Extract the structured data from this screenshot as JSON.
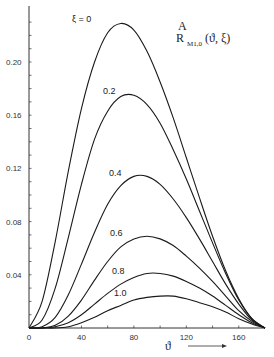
{
  "chart_data": {
    "type": "line",
    "title_parts": {
      "main": "R",
      "sup": "A",
      "sub": "M1,0",
      "args": "(ϑ, ξ)"
    },
    "xlabel": "ϑ",
    "ylabel": "",
    "xlim": [
      0,
      180
    ],
    "ylim": [
      0,
      0.24
    ],
    "x_ticks": [
      0,
      40,
      80,
      120,
      160
    ],
    "x_tick_labels": [
      "0",
      "40",
      "80",
      "120",
      "160"
    ],
    "y_ticks": [
      0.04,
      0.08,
      0.12,
      0.16,
      0.2
    ],
    "y_tick_labels": [
      "0.04",
      "0.08",
      "0.12",
      "0.16",
      "0.20"
    ],
    "grid": false,
    "legend": "inline curve labels",
    "x": [
      0,
      10,
      20,
      30,
      40,
      50,
      60,
      70,
      80,
      90,
      100,
      110,
      120,
      130,
      140,
      150,
      160,
      170,
      180
    ],
    "series": [
      {
        "name": "ξ = 0",
        "label": "ξ = 0",
        "values": [
          0,
          0.02,
          0.065,
          0.118,
          0.165,
          0.2,
          0.222,
          0.229,
          0.224,
          0.208,
          0.185,
          0.158,
          0.128,
          0.098,
          0.069,
          0.043,
          0.022,
          0.007,
          0
        ]
      },
      {
        "name": "ξ = 0.2",
        "label": "0.2",
        "values": [
          0,
          0.006,
          0.03,
          0.068,
          0.108,
          0.142,
          0.163,
          0.174,
          0.175,
          0.168,
          0.154,
          0.134,
          0.112,
          0.088,
          0.064,
          0.041,
          0.021,
          0.007,
          0
        ]
      },
      {
        "name": "ξ = 0.4",
        "label": "0.4",
        "values": [
          0,
          0.001,
          0.008,
          0.025,
          0.048,
          0.072,
          0.093,
          0.107,
          0.114,
          0.114,
          0.108,
          0.097,
          0.083,
          0.067,
          0.05,
          0.033,
          0.018,
          0.006,
          0
        ]
      },
      {
        "name": "ξ = 0.6",
        "label": "0.6",
        "values": [
          0,
          0,
          0.002,
          0.009,
          0.021,
          0.036,
          0.05,
          0.061,
          0.067,
          0.069,
          0.067,
          0.062,
          0.054,
          0.045,
          0.035,
          0.024,
          0.013,
          0.005,
          0
        ]
      },
      {
        "name": "ξ = 0.8",
        "label": "0.8",
        "values": [
          0,
          0,
          0.001,
          0.004,
          0.01,
          0.018,
          0.026,
          0.033,
          0.038,
          0.041,
          0.041,
          0.039,
          0.035,
          0.03,
          0.024,
          0.017,
          0.01,
          0.004,
          0
        ]
      },
      {
        "name": "ξ = 1.0",
        "label": "1.0",
        "values": [
          0,
          0,
          0,
          0.001,
          0.004,
          0.008,
          0.013,
          0.017,
          0.021,
          0.023,
          0.024,
          0.024,
          0.022,
          0.019,
          0.016,
          0.012,
          0.007,
          0.003,
          0
        ]
      }
    ]
  },
  "plot_area": {
    "x0": 29,
    "x1": 265,
    "y0": 328,
    "y_top": 6,
    "px_per_unit_y": 1330
  },
  "labels": {
    "title_main": "R",
    "title_sup": "A",
    "title_sub": "M1,0",
    "title_args": "(ϑ, ξ)",
    "xaxis_symbol": "ϑ",
    "xaxis_arrow": "⟶"
  },
  "colors": {
    "line": "#1a1a1a",
    "axis": "#333333",
    "background": "#ffffff"
  }
}
